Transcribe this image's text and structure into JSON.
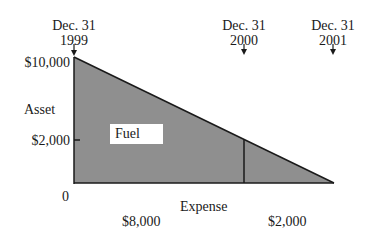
{
  "diagram": {
    "markers": [
      {
        "line1": "Dec. 31",
        "line2": "1999"
      },
      {
        "line1": "Dec. 31",
        "line2": "2000"
      },
      {
        "line1": "Dec. 31",
        "line2": "2001"
      }
    ],
    "y_axis": {
      "title": "Asset",
      "ticks": [
        {
          "label": "$10,000",
          "value": 10000
        },
        {
          "label": "$2,000",
          "value": 2000
        },
        {
          "label": "0",
          "value": 0
        }
      ]
    },
    "x_axis": {
      "title": "Expense",
      "segments": [
        {
          "label": "$8,000"
        },
        {
          "label": "$2,000"
        }
      ]
    },
    "region_label": "Fuel",
    "colors": {
      "fill": "#8f8f8f",
      "line": "#1a1a1a"
    }
  }
}
